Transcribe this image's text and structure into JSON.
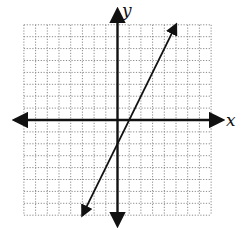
{
  "chart_data": {
    "type": "line",
    "title": "",
    "xlabel": "x",
    "ylabel": "y",
    "xlim": [
      -8,
      8
    ],
    "ylim": [
      -8,
      8
    ],
    "grid": true,
    "grid_style": "dotted",
    "grid_step": 1,
    "tick_labels": false,
    "legend": null,
    "series": [
      {
        "name": "line",
        "equation": "y = 2x - 2",
        "slope": 2,
        "y_intercept": -2,
        "x_intercept": 1,
        "x": [
          -3,
          5
        ],
        "y": [
          -8,
          8
        ],
        "arrows_both_ends": true
      }
    ]
  },
  "colors": {
    "background": "#ffffff",
    "axis": "#111111",
    "grid": "#8a8a8a",
    "line": "#111111"
  },
  "labels": {
    "x_axis": "x",
    "y_axis": "y"
  }
}
